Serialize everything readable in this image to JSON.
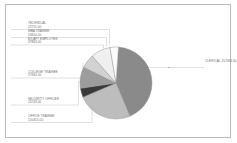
{
  "chart_data": {
    "type": "pie",
    "title": "",
    "legend_position": "callout-labels",
    "grid": false,
    "categories": [
      "CLERICAL",
      "OFFICE TRAINEE",
      "SECURITY OFFICER",
      "COLLEGE TRAINEE",
      "EX/AFT EMPLOYEE",
      "MBA TRAINEE",
      "TECHNICAL"
    ],
    "values": [
      257364.0,
      150455.0,
      24743.0,
      57844.0,
      37863.0,
      53650.0,
      22715.0
    ],
    "value_labels": [
      "257364.00",
      "150455.00",
      "24743.00",
      "57844.00",
      "37863.00",
      "53650.00",
      "22715.00"
    ],
    "colors": [
      "#8a8a8a",
      "#bdbdbd",
      "#3a3a3a",
      "#9d9d9d",
      "#d2d2d2",
      "#efefef",
      "#fbfbfb"
    ],
    "slice_order_note": "clockwise from 12 o'clock",
    "xlabel": "",
    "ylabel": ""
  },
  "labels": {
    "technical": {
      "name": "TECHNICAL",
      "value": "22715.00"
    },
    "mba_trainee": {
      "name": "MBA TRAINEE",
      "value": "53650.00"
    },
    "ex_aft_employee": {
      "name": "EX/AFT EMPLOYEE",
      "value": "37863.00"
    },
    "college_trainee": {
      "name": "COLLEGE TRAINEE",
      "value": "57844.00"
    },
    "security_officer": {
      "name": "SECURITY OFFICER",
      "value": "24743.00"
    },
    "office_trainee": {
      "name": "OFFICE TRAINEE",
      "value": "150455.00"
    },
    "clerical": {
      "name": "CLERICAL",
      "value": "257364.00"
    }
  },
  "style": {
    "frame_border": "#b9b9b9",
    "leader_line": "#b0b0b0",
    "text": "#6e6e6e",
    "slice_outline": "#8f8f8f"
  }
}
